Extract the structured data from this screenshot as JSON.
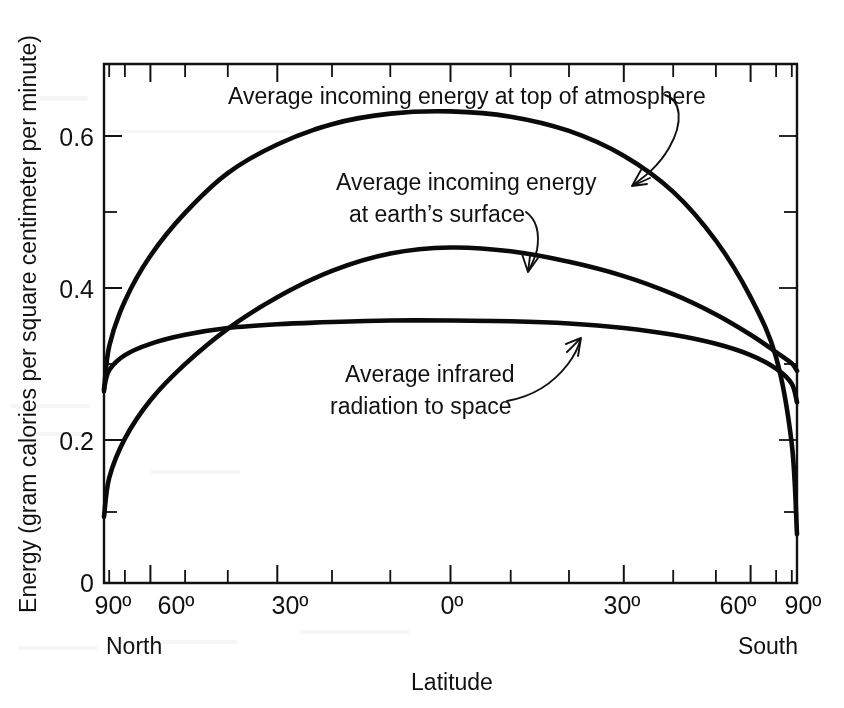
{
  "chart_data": {
    "type": "line",
    "title": "",
    "xlabel": "Latitude",
    "ylabel": "Energy (gram calories per square centimeter per minute)",
    "x_axis": {
      "scale": "sine-latitude",
      "left_pole": "90° North",
      "right_pole": "90° South",
      "tick_labels": [
        "90º",
        "60º",
        "30º",
        "0º",
        "30º",
        "60º",
        "90º"
      ],
      "tick_latitudes": [
        90,
        60,
        30,
        0,
        -30,
        -60,
        -90
      ],
      "minor_tick_step_degrees": 10,
      "hemisphere_left": "North",
      "hemisphere_right": "South"
    },
    "y_axis": {
      "tick_labels": [
        "0",
        "0.2",
        "0.4",
        "0.6"
      ],
      "tick_values": [
        0,
        0.2,
        0.4,
        0.6
      ],
      "ylim": [
        0,
        0.69
      ],
      "minor_ticks": true
    },
    "grid": false,
    "legend": "inline-annotations",
    "latitudes": [
      90,
      80,
      70,
      60,
      50,
      40,
      30,
      20,
      10,
      0,
      -10,
      -20,
      -30,
      -40,
      -50,
      -60,
      -70,
      -80,
      -90
    ],
    "series": [
      {
        "name": "Average incoming energy at top of atmosphere",
        "values": [
          0.255,
          0.315,
          0.375,
          0.435,
          0.492,
          0.545,
          0.583,
          0.61,
          0.624,
          0.627,
          0.62,
          0.601,
          0.568,
          0.52,
          0.455,
          0.38,
          0.3,
          0.185,
          0.065
        ]
      },
      {
        "name": "Average incoming energy at earth's surface",
        "values": [
          0.088,
          0.14,
          0.192,
          0.243,
          0.291,
          0.338,
          0.38,
          0.415,
          0.438,
          0.446,
          0.441,
          0.427,
          0.408,
          0.384,
          0.357,
          0.33,
          0.307,
          0.292,
          0.282
        ]
      },
      {
        "name": "Average infrared radiation to space",
        "values": [
          0.258,
          0.283,
          0.303,
          0.318,
          0.33,
          0.339,
          0.344,
          0.347,
          0.349,
          0.349,
          0.348,
          0.345,
          0.339,
          0.33,
          0.318,
          0.303,
          0.285,
          0.265,
          0.24
        ]
      }
    ],
    "annotations": [
      {
        "id": "top-of-atmosphere",
        "text_lines": [
          "Average incoming energy at top of atmosphere"
        ],
        "points_to_series": "Average incoming energy at top of atmosphere"
      },
      {
        "id": "earths-surface",
        "text_lines": [
          "Average incoming energy",
          "at earth’s surface"
        ],
        "points_to_series": "Average incoming energy at earth's surface"
      },
      {
        "id": "infrared",
        "text_lines": [
          "Average  infrared",
          "radiation to space"
        ],
        "points_to_series": "Average infrared radiation to space"
      }
    ],
    "colors": {
      "curve": "#0a0a0a",
      "axis": "#111111",
      "background": "#ffffff"
    }
  }
}
